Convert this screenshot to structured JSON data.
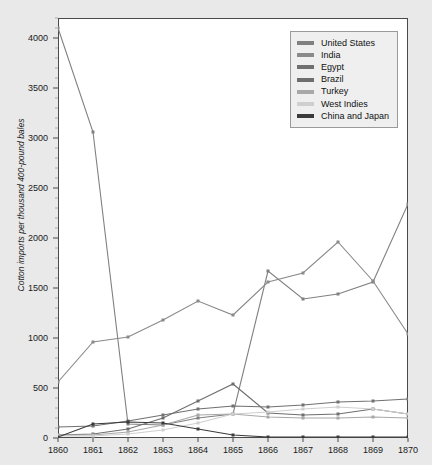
{
  "chart_data": {
    "type": "line",
    "title": "",
    "xlabel": "",
    "ylabel": "Cotton imports per thousand 400-pound bales",
    "x": [
      1860,
      1861,
      1862,
      1863,
      1864,
      1865,
      1866,
      1867,
      1868,
      1869,
      1870
    ],
    "xticklabels": [
      "1860",
      "1861",
      "1862",
      "1863",
      "1864",
      "1865",
      "1866",
      "1867",
      "1868",
      "1869",
      "1870"
    ],
    "yticklabels": [
      "0",
      "500",
      "1000",
      "1500",
      "2000",
      "2500",
      "3000",
      "3500",
      "4000"
    ],
    "yticks": [
      0,
      500,
      1000,
      1500,
      2000,
      2500,
      3000,
      3500,
      4000
    ],
    "xlim": [
      1860,
      1870
    ],
    "ylim": [
      0,
      4200
    ],
    "grid": false,
    "legend_position": "top-right",
    "series": [
      {
        "name": "United States",
        "color": "#808080",
        "values": [
          4100,
          3060,
          140,
          130,
          200,
          240,
          1670,
          1390,
          1440,
          1560,
          2340
        ]
      },
      {
        "name": "India",
        "color": "#8a8a8a",
        "values": [
          560,
          960,
          1010,
          1180,
          1370,
          1230,
          1560,
          1650,
          1960,
          1570,
          1040
        ]
      },
      {
        "name": "Egypt",
        "color": "#707070",
        "values": [
          110,
          120,
          170,
          230,
          290,
          320,
          310,
          330,
          360,
          370,
          390
        ]
      },
      {
        "name": "Brazil",
        "color": "#6e6e6e",
        "values": [
          30,
          40,
          90,
          200,
          370,
          540,
          250,
          230,
          240,
          290,
          240
        ]
      },
      {
        "name": "Turkey",
        "color": "#a8a8a8",
        "values": [
          30,
          30,
          60,
          130,
          230,
          240,
          210,
          200,
          200,
          210,
          200
        ]
      },
      {
        "name": "West Indies",
        "color": "#cfcfcf",
        "values": [
          20,
          20,
          40,
          80,
          150,
          240,
          260,
          290,
          310,
          290,
          240
        ]
      },
      {
        "name": "China and Japan",
        "color": "#3a3a3a",
        "values": [
          10,
          140,
          160,
          150,
          90,
          30,
          10,
          10,
          10,
          10,
          10
        ]
      }
    ]
  }
}
